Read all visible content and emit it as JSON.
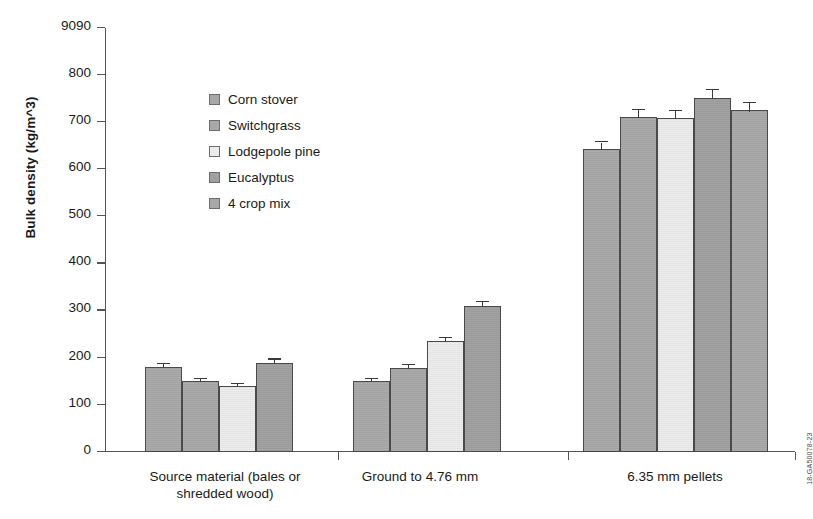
{
  "chart_data": {
    "type": "bar",
    "title": "",
    "xlabel": "",
    "ylabel": "Bulk density (kg/m^3)",
    "ylim": [
      0,
      900
    ],
    "ytick_labels": [
      "9090",
      "800",
      "700",
      "600",
      "500",
      "400",
      "300",
      "200",
      "100",
      "0"
    ],
    "ytick_values": [
      900,
      800,
      700,
      600,
      500,
      400,
      300,
      200,
      100,
      0
    ],
    "grid": false,
    "legend_position": "inside-upper-left",
    "categories": [
      "Source material (bales or shredded wood)",
      "Ground to 4.76 mm",
      "6.35 mm pellets"
    ],
    "category_lines": [
      [
        "Source material (bales or",
        "shredded wood)"
      ],
      [
        "Ground to 4.76 mm"
      ],
      [
        "6.35 mm pellets"
      ]
    ],
    "series": [
      {
        "name": "Corn stover",
        "color": "#a8a8a8",
        "values": [
          180,
          150,
          643
        ],
        "errors": [
          6,
          5,
          14
        ]
      },
      {
        "name": "Switchgrass",
        "color": "#a8a8a8",
        "values": [
          150,
          178,
          712
        ],
        "errors": [
          5,
          6,
          14
        ]
      },
      {
        "name": "Lodgepole pine",
        "color": "#ececec",
        "values": [
          140,
          235,
          710
        ],
        "errors": [
          4,
          7,
          14
        ]
      },
      {
        "name": "Eucalyptus",
        "color": "#a0a0a0",
        "values": [
          190,
          310,
          752
        ],
        "errors": [
          6,
          8,
          16
        ]
      },
      {
        "name": "4 crop mix",
        "color": "#a8a8a8",
        "values": [
          null,
          null,
          725
        ],
        "errors": [
          null,
          null,
          15
        ]
      }
    ]
  },
  "figure_stamp": "18-GA50078-23"
}
